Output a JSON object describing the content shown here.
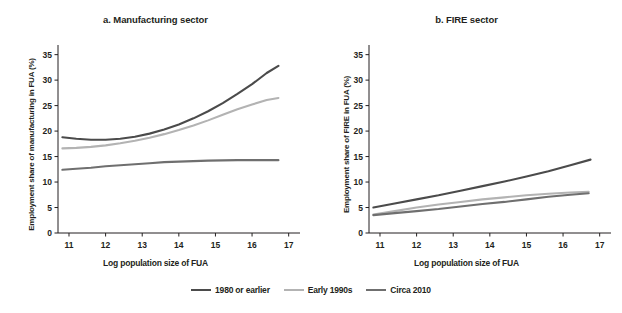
{
  "figure": {
    "background": "#ffffff"
  },
  "legend": {
    "position": "bottom-center",
    "entries": [
      {
        "label": "1980 or earlier",
        "color": "#4b4b4b"
      },
      {
        "label": "Early 1990s",
        "color": "#b3b3b3"
      },
      {
        "label": "Circa 2010",
        "color": "#6f6f6f"
      }
    ]
  },
  "chart_data": [
    {
      "type": "line",
      "panel": "a",
      "title": "a. Manufacturing sector",
      "xlabel": "Log population size of FUA",
      "ylabel": "Employment share of manufacturing in FUA (%)",
      "xlim": [
        10.7,
        17.2
      ],
      "ylim": [
        0,
        36.5
      ],
      "xticks": [
        11,
        12,
        13,
        14,
        15,
        16,
        17
      ],
      "yticks": [
        0,
        5,
        10,
        15,
        20,
        25,
        30,
        35
      ],
      "grid": false,
      "series": [
        {
          "name": "1980 or earlier",
          "color": "#4b4b4b",
          "x": [
            10.82,
            11.2,
            11.6,
            12.0,
            12.4,
            12.8,
            13.2,
            13.6,
            14.0,
            14.4,
            14.8,
            15.2,
            15.6,
            16.0,
            16.4,
            16.72
          ],
          "y": [
            18.8,
            18.5,
            18.3,
            18.3,
            18.5,
            18.9,
            19.5,
            20.3,
            21.3,
            22.5,
            23.9,
            25.5,
            27.3,
            29.2,
            31.4,
            32.8
          ]
        },
        {
          "name": "Early 1990s",
          "color": "#b3b3b3",
          "x": [
            10.82,
            11.2,
            11.6,
            12.0,
            12.4,
            12.8,
            13.2,
            13.6,
            14.0,
            14.4,
            14.8,
            15.2,
            15.6,
            16.0,
            16.4,
            16.72
          ],
          "y": [
            16.6,
            16.7,
            16.9,
            17.2,
            17.6,
            18.1,
            18.7,
            19.4,
            20.2,
            21.1,
            22.1,
            23.2,
            24.3,
            25.2,
            26.1,
            26.5
          ]
        },
        {
          "name": "Circa 2010",
          "color": "#6f6f6f",
          "x": [
            10.82,
            11.2,
            11.6,
            12.0,
            12.4,
            12.8,
            13.2,
            13.6,
            14.0,
            14.4,
            14.8,
            15.2,
            15.6,
            16.0,
            16.4,
            16.72
          ],
          "y": [
            12.4,
            12.6,
            12.8,
            13.1,
            13.3,
            13.5,
            13.7,
            13.9,
            14.0,
            14.1,
            14.2,
            14.25,
            14.3,
            14.3,
            14.3,
            14.3
          ]
        }
      ]
    },
    {
      "type": "line",
      "panel": "b",
      "title": "b. FIRE sector",
      "xlabel": "Log population size of FUA",
      "ylabel": "Employment share of FIRE in FUA (%)",
      "xlim": [
        10.7,
        17.2
      ],
      "ylim": [
        0,
        36.5
      ],
      "xticks": [
        11,
        12,
        13,
        14,
        15,
        16,
        17
      ],
      "yticks": [
        0,
        5,
        10,
        15,
        20,
        25,
        30,
        35
      ],
      "grid": false,
      "series": [
        {
          "name": "1980 or earlier",
          "color": "#4b4b4b",
          "x": [
            10.82,
            11.4,
            12.0,
            12.6,
            13.2,
            13.8,
            14.4,
            15.0,
            15.6,
            16.2,
            16.75
          ],
          "y": [
            5.0,
            5.8,
            6.6,
            7.4,
            8.3,
            9.2,
            10.1,
            11.1,
            12.1,
            13.3,
            14.4
          ]
        },
        {
          "name": "Early 1990s",
          "color": "#b3b3b3",
          "x": [
            10.82,
            11.4,
            12.0,
            12.6,
            13.2,
            13.8,
            14.4,
            15.0,
            15.6,
            16.2,
            16.7
          ],
          "y": [
            3.6,
            4.3,
            5.0,
            5.6,
            6.1,
            6.6,
            7.0,
            7.4,
            7.7,
            7.95,
            8.1
          ]
        },
        {
          "name": "Circa 2010",
          "color": "#6f6f6f",
          "x": [
            10.82,
            11.4,
            12.0,
            12.6,
            13.2,
            13.8,
            14.4,
            15.0,
            15.6,
            16.2,
            16.7
          ],
          "y": [
            3.5,
            3.9,
            4.3,
            4.7,
            5.2,
            5.7,
            6.1,
            6.6,
            7.1,
            7.5,
            7.8
          ]
        }
      ]
    }
  ]
}
